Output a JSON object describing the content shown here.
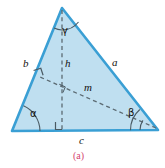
{
  "figure": {
    "caption": "(a)",
    "caption_color": "#d4456f",
    "fill_color": "#bfdff0",
    "stroke_color": "#3a9fd4",
    "dash_color": "#5b6a72",
    "label_color": "#13110f",
    "labels": {
      "side_a": "a",
      "side_b": "b",
      "side_c": "c",
      "height_h": "h",
      "median_m": "m",
      "angle_alpha": "α",
      "angle_beta": "β",
      "angle_gamma": "γ"
    },
    "geometry": {
      "apex": [
        62,
        8
      ],
      "bottom_left": [
        12,
        131
      ],
      "bottom_right": [
        158,
        130
      ],
      "altitude_foot": [
        62,
        131
      ],
      "median_foot_on_b": [
        40,
        77
      ]
    }
  }
}
